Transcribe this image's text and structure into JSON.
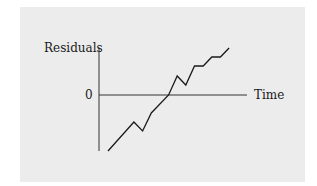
{
  "chart_data": {
    "type": "line",
    "title": "",
    "xlabel": "Time",
    "ylabel": "Residuals",
    "y_tick_labels": [
      "0"
    ],
    "grid": false,
    "legend": null,
    "series": [
      {
        "name": "residuals",
        "x": [
          1,
          4,
          5,
          6,
          8,
          9,
          10,
          11,
          12,
          13,
          14,
          15
        ],
        "values": [
          -56,
          -27,
          -36,
          -18,
          0,
          19,
          10,
          29,
          29,
          38,
          38,
          47
        ]
      }
    ],
    "ylim": [
      -56,
      47
    ],
    "axis_color": "#333333",
    "line_color": "#1a1a1a",
    "background_color": "#ececec"
  },
  "labels": {
    "ylabel": "Residuals",
    "xlabel": "Time",
    "zero": "0"
  }
}
